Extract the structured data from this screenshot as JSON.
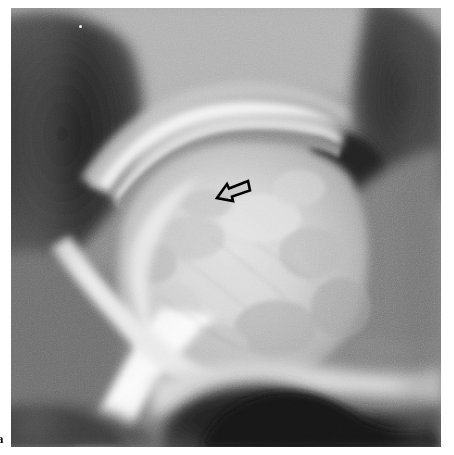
{
  "figure": {
    "modality": "radiograph",
    "body_region": "hip joint",
    "view": "anteroposterior",
    "label": "a",
    "background_color": "#ffffff",
    "plate": {
      "x": 11,
      "y": 8,
      "width": 430,
      "height": 439,
      "base_color": "#8d8d8d",
      "darkest_color": "#181818",
      "brightest_color": "#fcfcfc"
    },
    "annotations": [
      {
        "name": "lesion-arrow",
        "type": "hollow-arrow",
        "stroke_color": "#000000",
        "fill_color": "#c9c9c9",
        "direction": "down-left",
        "x": 203,
        "y": 168,
        "width": 40,
        "height": 30,
        "points_to": "subchondral lucency of the femoral head"
      }
    ],
    "anatomy_regions": [
      {
        "name": "iliac-wing-soft-tissue",
        "tone": "dark",
        "location": "upper-left"
      },
      {
        "name": "acetabular-roof",
        "tone": "bright",
        "location": "upper-center"
      },
      {
        "name": "joint-space",
        "tone": "dark-line",
        "location": "center-upper"
      },
      {
        "name": "femoral-head",
        "tone": "bright-mottled",
        "location": "center"
      },
      {
        "name": "femoral-neck",
        "tone": "mid",
        "location": "center-lower"
      },
      {
        "name": "greater-trochanter",
        "tone": "mid",
        "location": "right"
      },
      {
        "name": "obturator-foramen",
        "tone": "very-dark",
        "location": "bottom-center"
      },
      {
        "name": "pelvic-air-shadow",
        "tone": "very-dark",
        "location": "upper-right"
      },
      {
        "name": "cortical-bone-band",
        "tone": "bright-band",
        "location": "left-diagonal"
      }
    ],
    "artifacts": [
      {
        "name": "emulsion-speck",
        "x": 68,
        "y": 17,
        "color": "#f4f4f4"
      }
    ]
  }
}
